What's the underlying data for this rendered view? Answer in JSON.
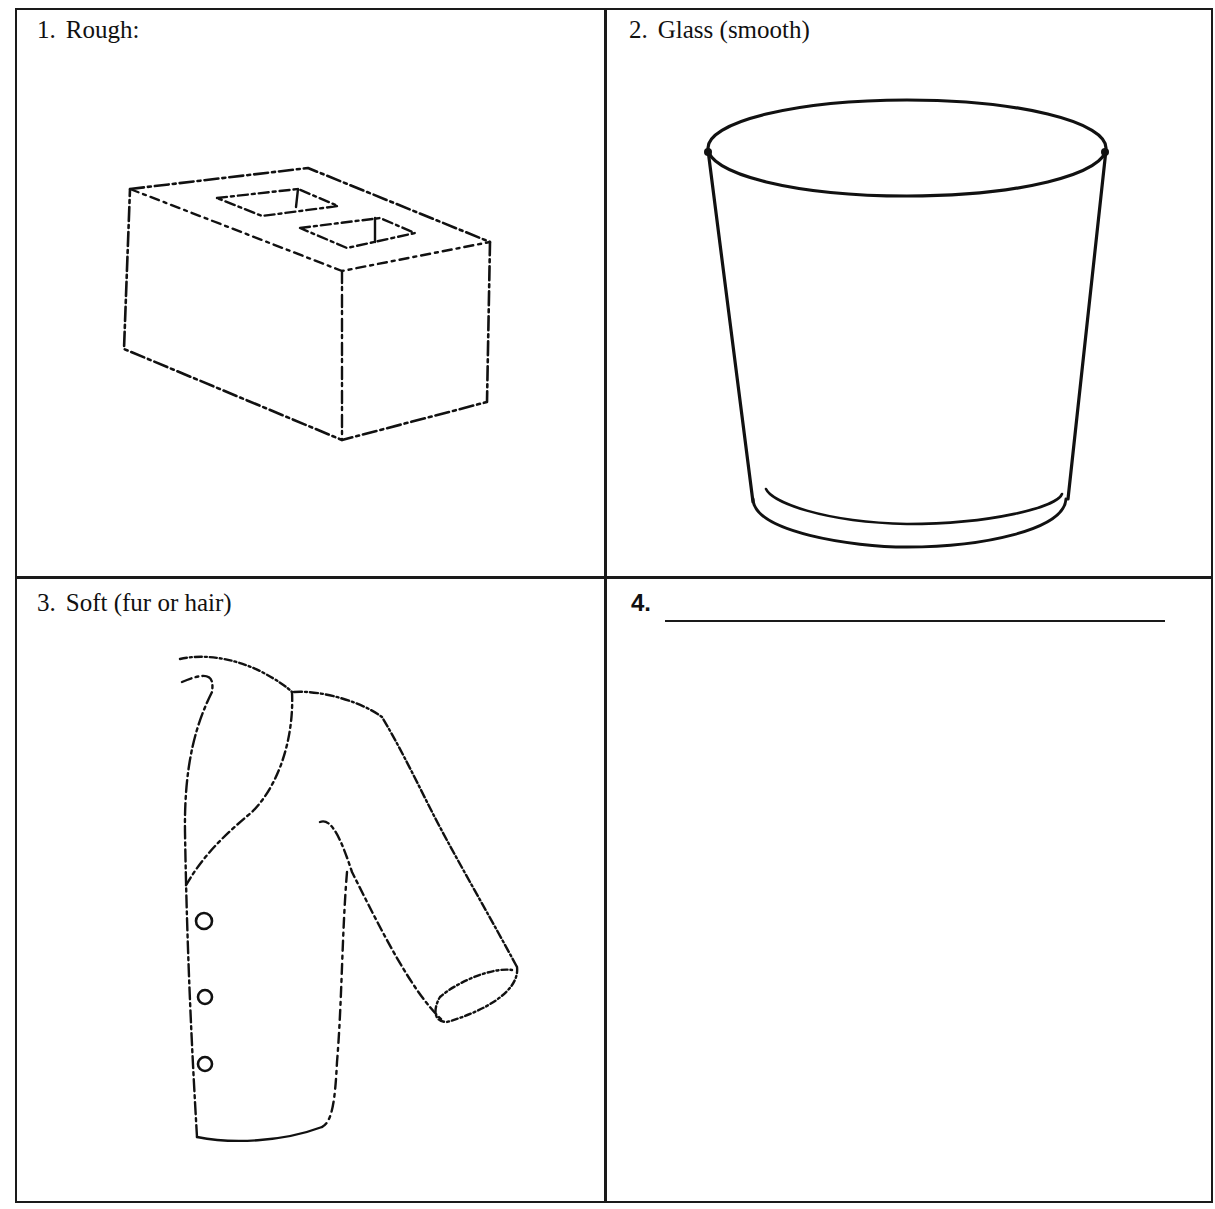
{
  "worksheet": {
    "layout": "2x2 grid",
    "cells": [
      {
        "number": "1.",
        "label": "Rough:",
        "illustration": "cinder-block",
        "illustration_description": "Cinder block drawn with rough, broken lines"
      },
      {
        "number": "2.",
        "label": "Glass (smooth)",
        "illustration": "drinking-glass",
        "illustration_description": "Drinking glass drawn with smooth, solid lines"
      },
      {
        "number": "3.",
        "label": "Soft (fur or hair)",
        "illustration": "fur-jacket",
        "illustration_description": "Jacket with three buttons drawn with fuzzy, dashed lines"
      },
      {
        "number": "4.",
        "label": "",
        "illustration": "none",
        "blank_line": true,
        "illustration_description": "Empty cell with blank line for writing"
      }
    ]
  },
  "colors": {
    "ink": "#111111",
    "border": "#1a1a1a",
    "paper": "#ffffff"
  }
}
